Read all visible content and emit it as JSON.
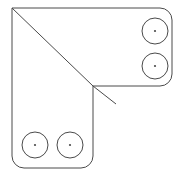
{
  "figure": {
    "background_color": "#ffffff",
    "stroke_color": "#4a4a4a",
    "stroke_width": 1,
    "canvas": {
      "width": 180,
      "height": 176
    }
  },
  "outline": {
    "name": "l-shaped-bracket-outline",
    "corner_radius": 12,
    "path": "M 12 8 L 160 8 A 12 12 0 0 1 172 20 L 172 74 A 12 12 0 0 1 160 86 L 93 86 L 93 156 A 12 12 0 0 1 81 168 L 24 168 A 12 12 0 0 1 12 156 Z",
    "vertices": [
      {
        "name": "top-left-sharp-corner",
        "x": 12,
        "y": 8
      },
      {
        "name": "top-right-corner",
        "x": 172,
        "y": 8
      },
      {
        "name": "right-lower-corner",
        "x": 172,
        "y": 86
      },
      {
        "name": "inner-corner",
        "x": 93,
        "y": 86
      },
      {
        "name": "bottom-right-corner",
        "x": 93,
        "y": 168
      },
      {
        "name": "bottom-left-corner",
        "x": 12,
        "y": 168
      }
    ]
  },
  "fold_lines": [
    {
      "name": "main-diagonal",
      "x1": 12,
      "y1": 8,
      "x2": 93,
      "y2": 86
    },
    {
      "name": "secondary-diagonal",
      "x1": 93,
      "y1": 86,
      "x2": 116,
      "y2": 104
    }
  ],
  "holes": [
    {
      "name": "hole-top-right-upper",
      "cx": 155,
      "cy": 31,
      "r": 13,
      "dot_r": 1.1
    },
    {
      "name": "hole-top-right-lower",
      "cx": 155,
      "cy": 66,
      "r": 13,
      "dot_r": 1.1
    },
    {
      "name": "hole-bottom-left-left",
      "cx": 35,
      "cy": 145,
      "r": 13,
      "dot_r": 1.1
    },
    {
      "name": "hole-bottom-left-right",
      "cx": 70,
      "cy": 145,
      "r": 13,
      "dot_r": 1.1
    }
  ]
}
